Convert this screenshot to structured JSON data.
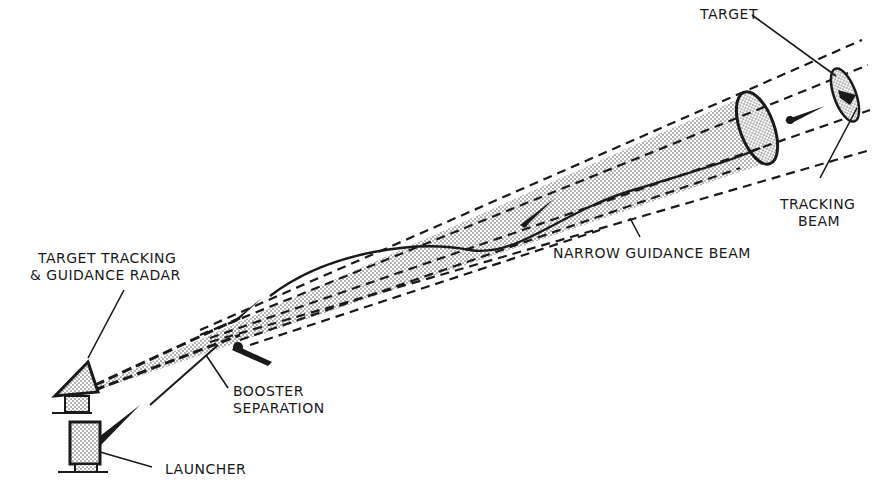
{
  "diagram": {
    "type": "beam-rider missile guidance illustration",
    "colors": {
      "ink": "#1a1a1a",
      "paper": "#ffffff",
      "stipple": "#bdbdbd"
    },
    "labels": {
      "target": "TARGET",
      "tracking_beam_line1": "TRACKING",
      "tracking_beam_line2": "BEAM",
      "narrow_guidance_beam": "NARROW GUIDANCE BEAM",
      "radar_line1": "TARGET TRACKING",
      "radar_line2": "& GUIDANCE RADAR",
      "booster_line1": "BOOSTER",
      "booster_line2": "SEPARATION",
      "launcher": "LAUNCHER"
    },
    "components": [
      {
        "name": "Target Tracking & Guidance Radar",
        "role": "emits tracking and guidance beams"
      },
      {
        "name": "Launcher",
        "role": "launches missile"
      },
      {
        "name": "Booster Separation",
        "role": "booster detaches after launch"
      },
      {
        "name": "Narrow Guidance Beam",
        "role": "missile rides beam toward target"
      },
      {
        "name": "Tracking Beam",
        "role": "tracks target"
      },
      {
        "name": "Target",
        "role": "aircraft being engaged"
      }
    ]
  }
}
